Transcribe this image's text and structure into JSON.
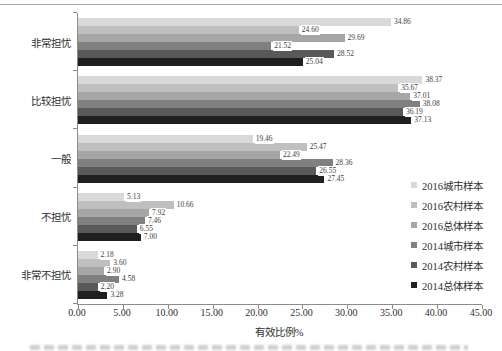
{
  "chart_data": {
    "type": "bar",
    "orientation": "horizontal",
    "title": "",
    "xlabel": "有效比例%",
    "ylabel": "",
    "xlim": [
      0,
      45
    ],
    "xticks": [
      "0.00",
      "5.00",
      "10.00",
      "15.00",
      "20.00",
      "25.00",
      "30.00",
      "35.00",
      "40.00",
      "45.00"
    ],
    "grid": false,
    "legend_position": "right",
    "categories": [
      "非常担忧",
      "比较担忧",
      "一般",
      "不担忧",
      "非常不担忧"
    ],
    "series": [
      {
        "name": "2016城市样本",
        "color": "#d9d9d9",
        "values": [
          34.86,
          38.37,
          19.46,
          5.13,
          2.18
        ]
      },
      {
        "name": "2016农村样本",
        "color": "#bfbfbf",
        "values": [
          24.6,
          35.67,
          25.47,
          10.66,
          3.6
        ]
      },
      {
        "name": "2016总体样本",
        "color": "#a6a6a6",
        "values": [
          29.69,
          37.01,
          22.49,
          7.92,
          2.9
        ]
      },
      {
        "name": "2014城市样本",
        "color": "#808080",
        "values": [
          21.52,
          38.08,
          28.36,
          7.46,
          4.58
        ]
      },
      {
        "name": "2014农村样本",
        "color": "#595959",
        "values": [
          28.52,
          36.19,
          26.55,
          6.55,
          2.2
        ]
      },
      {
        "name": "2014总体样本",
        "color": "#1f1f1f",
        "values": [
          25.04,
          37.13,
          27.45,
          7.0,
          3.28
        ]
      }
    ],
    "value_label_decimals": 2
  }
}
